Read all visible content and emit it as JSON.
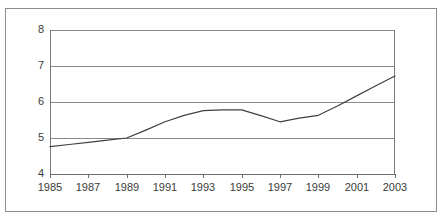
{
  "chart_data": {
    "type": "line",
    "title": "",
    "subtitle": "",
    "xlabel": "",
    "ylabel": "",
    "xlim": [
      1985,
      2003
    ],
    "ylim": [
      4,
      8
    ],
    "grid": true,
    "legend": false,
    "legend_position": "none",
    "y_ticks": [
      8,
      7,
      6,
      5,
      4
    ],
    "y_tick_labels": [
      "8",
      "7",
      "6",
      "5",
      "4"
    ],
    "x_ticks": [
      1985,
      1987,
      1989,
      1991,
      1993,
      1995,
      1997,
      1999,
      2001,
      2003
    ],
    "x_tick_labels": [
      "1985",
      "1987",
      "1989",
      "1991",
      "1993",
      "1995",
      "1997",
      "1999",
      "2001",
      "2003"
    ],
    "line_color": "#404040",
    "line_width": 1.2,
    "series": [
      {
        "name": "series-1",
        "x": [
          1985,
          1986,
          1987,
          1988,
          1989,
          1990,
          1991,
          1992,
          1993,
          1994,
          1995,
          1996,
          1997,
          1998,
          1999,
          2000,
          2001,
          2002,
          2003
        ],
        "values": [
          4.76,
          4.82,
          4.88,
          4.94,
          5.0,
          5.22,
          5.45,
          5.63,
          5.76,
          5.78,
          5.78,
          5.62,
          5.45,
          5.55,
          5.63,
          5.89,
          6.17,
          6.45,
          6.72
        ]
      }
    ]
  },
  "figure": {
    "background_color": "#ffffff",
    "frame_color": "#8c8c8c",
    "gridline_color": "#8a8a8a",
    "axis_color": "#6e6e6e",
    "tick_label_color": "#3b3b3b"
  }
}
